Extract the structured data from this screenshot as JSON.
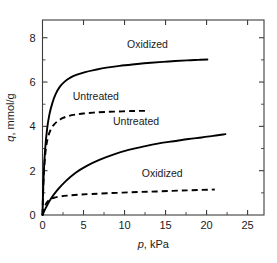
{
  "chart_data": {
    "type": "line",
    "title": "",
    "subtitle": "",
    "xlabel": "p, kPa",
    "ylabel": "q, mmol/g",
    "xlim": [
      0,
      27
    ],
    "ylim": [
      0,
      8.8
    ],
    "grid": false,
    "legend_position": "inline-annotations",
    "x_ticks": [
      0,
      5,
      10,
      15,
      20,
      25
    ],
    "x_tick_labels": [
      "0",
      "5",
      "10",
      "15",
      "20",
      "25"
    ],
    "x_minor_ticks": [
      2.5,
      7.5,
      12.5,
      17.5,
      22.5
    ],
    "y_ticks": [
      0,
      2,
      4,
      6,
      8
    ],
    "y_tick_labels": [
      "0",
      "2",
      "4",
      "6",
      "8"
    ],
    "y_minor_ticks": [
      1,
      3,
      5,
      7
    ],
    "axis_italic_symbols": {
      "x": "p",
      "y": "q"
    },
    "series": [
      {
        "name": "Oxidized",
        "style": "solid",
        "annotation": "Oxidized",
        "annotation_x": 12.8,
        "annotation_y": 7.55,
        "x": [
          0,
          0.12,
          0.3,
          0.55,
          0.85,
          1.2,
          1.6,
          2.1,
          2.7,
          3.4,
          4.2,
          5.2,
          6.4,
          7.8,
          9.4,
          11.2,
          13.2,
          15.4,
          17.6,
          19.0,
          20.1
        ],
        "y": [
          0,
          1.55,
          2.85,
          3.85,
          4.55,
          5.05,
          5.45,
          5.78,
          6.02,
          6.2,
          6.33,
          6.45,
          6.55,
          6.65,
          6.73,
          6.8,
          6.87,
          6.93,
          6.98,
          7.0,
          7.02
        ]
      },
      {
        "name": "Untreated",
        "style": "dashed",
        "annotation": "Untreated",
        "annotation_x": 6.5,
        "annotation_y": 5.2,
        "x": [
          0,
          0.1,
          0.25,
          0.45,
          0.7,
          1.0,
          1.4,
          1.9,
          2.5,
          3.2,
          4.0,
          5.0,
          6.2,
          7.6,
          9.2,
          10.8,
          12.0,
          13.0
        ],
        "y": [
          0,
          1.35,
          2.35,
          3.1,
          3.55,
          3.85,
          4.08,
          4.25,
          4.38,
          4.47,
          4.53,
          4.58,
          4.62,
          4.65,
          4.67,
          4.69,
          4.7,
          4.7
        ]
      },
      {
        "name": "Untreated",
        "style": "solid",
        "annotation": "Untreated",
        "annotation_x": 11.4,
        "annotation_y": 4.05,
        "x": [
          0,
          0.4,
          1.0,
          1.8,
          2.8,
          4.0,
          5.4,
          7.0,
          8.8,
          10.6,
          12.4,
          14.2,
          16.0,
          17.8,
          19.4,
          20.8,
          22.0,
          22.3
        ],
        "y": [
          0,
          0.32,
          0.72,
          1.12,
          1.52,
          1.9,
          2.22,
          2.5,
          2.75,
          2.95,
          3.1,
          3.23,
          3.33,
          3.43,
          3.5,
          3.57,
          3.63,
          3.65
        ]
      },
      {
        "name": "Oxidized",
        "style": "dashed",
        "annotation": "Oxidized",
        "annotation_x": 14.6,
        "annotation_y": 1.72,
        "x": [
          0,
          0.2,
          0.5,
          0.9,
          1.4,
          2.2,
          3.2,
          4.5,
          6.0,
          7.8,
          9.8,
          11.8,
          13.8,
          15.8,
          17.6,
          19.2,
          20.4,
          21.0
        ],
        "y": [
          0,
          0.3,
          0.55,
          0.7,
          0.78,
          0.84,
          0.88,
          0.92,
          0.95,
          0.98,
          1.01,
          1.04,
          1.06,
          1.09,
          1.11,
          1.13,
          1.14,
          1.15
        ]
      }
    ]
  }
}
